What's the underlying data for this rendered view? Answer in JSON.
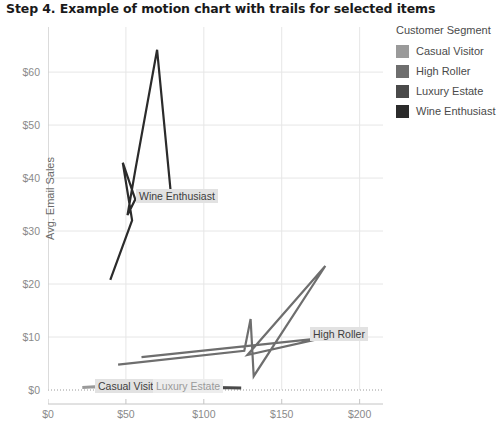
{
  "title": "Step 4.  Example of motion chart with trails for selected items",
  "legend": {
    "title": "Customer Segment",
    "items": [
      {
        "label": "Casual Visitor",
        "color": "#9a9a9a"
      },
      {
        "label": "High Roller",
        "color": "#6e6e6e"
      },
      {
        "label": "Luxury Estate",
        "color": "#4a4a4a"
      },
      {
        "label": "Wine Enthusiast",
        "color": "#2b2b2b"
      }
    ]
  },
  "labels": {
    "wine_enthusiast": "Wine Enthusiast",
    "high_roller": "High Roller",
    "casual_visitor": "Casual Visitor",
    "luxury_estate": "Luxury Estate"
  },
  "chart_data": {
    "type": "line",
    "title": "Step 4.  Example of motion chart with trails for selected items",
    "xlabel": "Avg. Tasting Room Sales",
    "ylabel": "Avg. Email Sales",
    "xlim": [
      0,
      215
    ],
    "ylim": [
      0,
      67
    ],
    "xticks": [
      0,
      50,
      100,
      150,
      200
    ],
    "xtick_labels": [
      "$0",
      "$50",
      "$100",
      "$150",
      "$200"
    ],
    "yticks": [
      0,
      10,
      20,
      30,
      40,
      50,
      60
    ],
    "ytick_labels": [
      "$0",
      "$10",
      "$20",
      "$30",
      "$40",
      "$50",
      "$60"
    ],
    "grid": true,
    "legend_position": "right",
    "series": [
      {
        "name": "Casual Visitor",
        "color": "#9a9a9a",
        "points": [
          [
            22,
            0.5
          ],
          [
            30,
            0.6
          ],
          [
            38,
            0.5
          ],
          [
            46,
            0.7
          ],
          [
            55,
            0.5
          ],
          [
            63,
            0.6
          ],
          [
            72,
            0.4
          ],
          [
            80,
            0.6
          ],
          [
            90,
            0.5
          ]
        ]
      },
      {
        "name": "High Roller",
        "color": "#6e6e6e",
        "points": [
          [
            45,
            4.8
          ],
          [
            126,
            7.4
          ],
          [
            130,
            13.4
          ],
          [
            132,
            2.6
          ],
          [
            178,
            23.4
          ],
          [
            128,
            6.6
          ],
          [
            176,
            9.8
          ],
          [
            60,
            6.2
          ]
        ]
      },
      {
        "name": "Luxury Estate",
        "color": "#4a4a4a",
        "points": [
          [
            58,
            0.4
          ],
          [
            74,
            0.5
          ],
          [
            92,
            0.3
          ],
          [
            108,
            0.5
          ],
          [
            124,
            0.4
          ]
        ]
      },
      {
        "name": "Wine Enthusiast",
        "color": "#2b2b2b",
        "points": [
          [
            40,
            20.8
          ],
          [
            54,
            32.0
          ],
          [
            48,
            42.9
          ],
          [
            56,
            36.0
          ],
          [
            51,
            33.0
          ],
          [
            56,
            41.5
          ],
          [
            70,
            64.2
          ],
          [
            79,
            36.6
          ]
        ]
      }
    ]
  }
}
